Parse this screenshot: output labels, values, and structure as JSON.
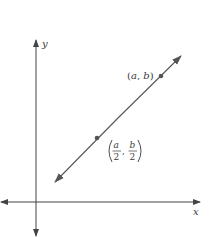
{
  "diagram": {
    "type": "coordinate-plane-line",
    "axes": {
      "x_label": "x",
      "y_label": "y"
    },
    "line": {
      "description": "Line through the origin direction with arrows at both ends, passing through two marked points",
      "color": "#555555"
    },
    "points": [
      {
        "name": "endpoint",
        "label": "(a, b)",
        "label_parts": {
          "open": "(",
          "x": "a",
          "sep": ", ",
          "y": "b",
          "close": ")"
        }
      },
      {
        "name": "midpoint",
        "label": "(a/2, b/2)",
        "label_parts": {
          "x_num": "a",
          "x_den": "2",
          "y_num": "b",
          "y_den": "2",
          "sep": ","
        }
      }
    ],
    "colors": {
      "axis": "#444444",
      "line": "#555555",
      "point": "#555555",
      "text": "#3a3a3a",
      "background": "#ffffff"
    }
  }
}
